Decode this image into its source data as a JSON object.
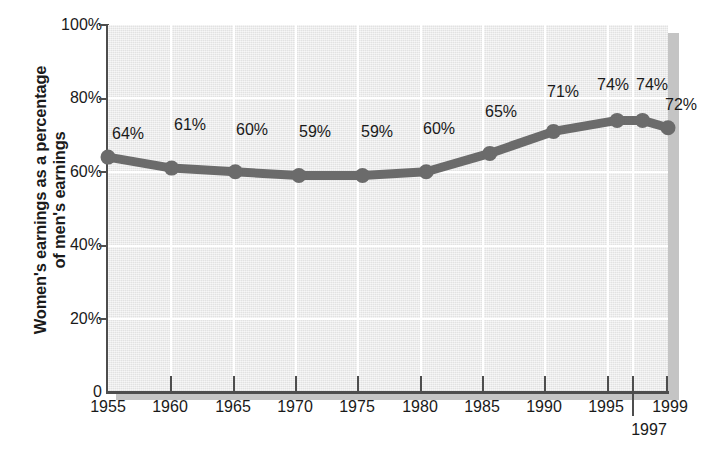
{
  "chart_data": {
    "type": "line",
    "title": "",
    "xlabel": "",
    "ylabel": "Women's earnings as a percentage of men's earnings",
    "ylabel_lines": [
      "Women's earnings as a percentage",
      "of men's earnings"
    ],
    "categories": [
      "1955",
      "1960",
      "1965",
      "1970",
      "1975",
      "1980",
      "1985",
      "1990",
      "1995",
      "1997",
      "1999"
    ],
    "x": [
      1955,
      1960,
      1965,
      1970,
      1975,
      1980,
      1985,
      1990,
      1995,
      1997,
      1999
    ],
    "values": [
      64,
      61,
      60,
      59,
      59,
      60,
      65,
      71,
      74,
      74,
      72
    ],
    "point_labels": [
      "64%",
      "61%",
      "60%",
      "59%",
      "59%",
      "60%",
      "65%",
      "71%",
      "74%",
      "74%",
      "72%"
    ],
    "ylim": [
      0,
      100
    ],
    "xlim": [
      1955,
      1999
    ],
    "y_ticks": [
      0,
      20,
      40,
      60,
      80,
      100
    ],
    "y_tick_labels": [
      "0",
      "20%",
      "40%",
      "60%",
      "80%",
      "100%"
    ],
    "x_ticks": [
      1955,
      1960,
      1965,
      1970,
      1975,
      1980,
      1985,
      1990,
      1995,
      1997,
      1999
    ],
    "x_tick_labels": [
      "1955",
      "1960",
      "1965",
      "1970",
      "1975",
      "1980",
      "1985",
      "1990",
      "1995",
      "1997",
      "1999"
    ],
    "grid": "both",
    "grid_color": "#ffffff",
    "legend": "none",
    "series_color": "#6b6b6b",
    "marker": "circle",
    "plot_background": "#e8e8e8"
  },
  "axes": {
    "y_title_line1": "Women's earnings as a percentage",
    "y_title_line2": "of men's earnings",
    "y_labels": {
      "t100": "100%",
      "t80": "80%",
      "t60": "60%",
      "t40": "40%",
      "t20": "20%",
      "t0": "0"
    },
    "x_labels": {
      "y1955": "1955",
      "y1960": "1960",
      "y1965": "1965",
      "y1970": "1970",
      "y1975": "1975",
      "y1980": "1980",
      "y1985": "1985",
      "y1990": "1990",
      "y1995": "1995",
      "y1997": "1997",
      "y1999": "1999"
    }
  },
  "data_labels": {
    "p0": "64%",
    "p1": "61%",
    "p2": "60%",
    "p3": "59%",
    "p4": "59%",
    "p5": "60%",
    "p6": "65%",
    "p7": "71%",
    "p8": "74%",
    "p9": "74%",
    "p10": "72%"
  }
}
